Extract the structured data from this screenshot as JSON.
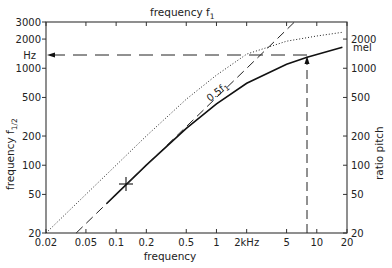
{
  "chart_data": {
    "type": "line",
    "top_axis_label": "frequency f₁",
    "xlabel": "frequency",
    "ylabel_left": "frequency f₁/₂",
    "ylabel_right": "ratio pitch",
    "x_scale": "log",
    "y_scale": "log",
    "xlim": [
      0.02,
      20
    ],
    "ylim_left": [
      20,
      3000
    ],
    "ylim_right": [
      20,
      3000
    ],
    "x_ticks": [
      "0.02",
      "0.05",
      "0.1",
      "0.2",
      "0.5",
      "1",
      "2kHz",
      "5",
      "10",
      "20"
    ],
    "y_ticks_left": [
      "20",
      "50",
      "100",
      "200",
      "500",
      "1000",
      "Hz",
      "2000",
      "3000"
    ],
    "y_ticks_right": [
      "20",
      "50",
      "100",
      "200",
      "500",
      "1000",
      "mel",
      "2000"
    ],
    "series": [
      {
        "name": "ratio pitch (mel) - dotted",
        "style": "dotted",
        "x": [
          0.02,
          0.05,
          0.1,
          0.2,
          0.5,
          1,
          2,
          5,
          10,
          18
        ],
        "y": [
          20,
          50,
          100,
          200,
          480,
          850,
          1400,
          1900,
          2150,
          2350
        ]
      },
      {
        "name": "frequency f1/2 - solid",
        "style": "solid",
        "x": [
          0.08,
          0.1,
          0.2,
          0.5,
          1,
          2,
          5,
          8,
          18
        ],
        "y": [
          40,
          50,
          100,
          240,
          430,
          700,
          1100,
          1300,
          1650
        ]
      },
      {
        "name": "0.5 f1 - dash-dot",
        "style": "dashdot",
        "x": [
          0.04,
          0.1,
          0.2,
          0.5,
          1,
          2,
          5,
          6
        ],
        "y": [
          20,
          50,
          100,
          250,
          500,
          1000,
          2500,
          3000
        ]
      }
    ],
    "annotations": [
      {
        "text": "0.5f₁",
        "x": 0.8,
        "y": 550
      },
      {
        "type": "crosshair",
        "x": 0.13,
        "y": 125
      },
      {
        "type": "arrow-up",
        "x": 8,
        "from_y": 20,
        "to_y": 1350
      },
      {
        "type": "arrow-left",
        "y": 1350,
        "from_x": 8,
        "to_x": 0.02
      }
    ],
    "grid": false,
    "legend": "none"
  },
  "labels": {
    "top": "frequency f",
    "top_sub": "1",
    "bottom": "frequency",
    "left": "frequency f",
    "left_sub": "1/2",
    "right": "ratio pitch",
    "curve_note": "0.5f",
    "curve_note_sub": "1",
    "hz": "Hz",
    "mel": "mel"
  },
  "ticks": {
    "x": [
      {
        "t": "0.02",
        "v": 0.02
      },
      {
        "t": "0.05",
        "v": 0.05
      },
      {
        "t": "0.1",
        "v": 0.1
      },
      {
        "t": "0.2",
        "v": 0.2
      },
      {
        "t": "0.5",
        "v": 0.5
      },
      {
        "t": "1",
        "v": 1
      },
      {
        "t": "2kHz",
        "v": 2
      },
      {
        "t": "5",
        "v": 5
      },
      {
        "t": "10",
        "v": 10
      },
      {
        "t": "20",
        "v": 20
      }
    ],
    "yl": [
      {
        "t": "20",
        "v": 20
      },
      {
        "t": "50",
        "v": 50
      },
      {
        "t": "100",
        "v": 100
      },
      {
        "t": "200",
        "v": 200
      },
      {
        "t": "500",
        "v": 500
      },
      {
        "t": "1000",
        "v": 1000
      },
      {
        "t": "2000",
        "v": 2000
      },
      {
        "t": "3000",
        "v": 3000
      }
    ],
    "yr": [
      {
        "t": "20",
        "v": 20
      },
      {
        "t": "50",
        "v": 50
      },
      {
        "t": "100",
        "v": 100
      },
      {
        "t": "200",
        "v": 200
      },
      {
        "t": "500",
        "v": 500
      },
      {
        "t": "1000",
        "v": 1000
      },
      {
        "t": "2000",
        "v": 2000
      }
    ]
  }
}
